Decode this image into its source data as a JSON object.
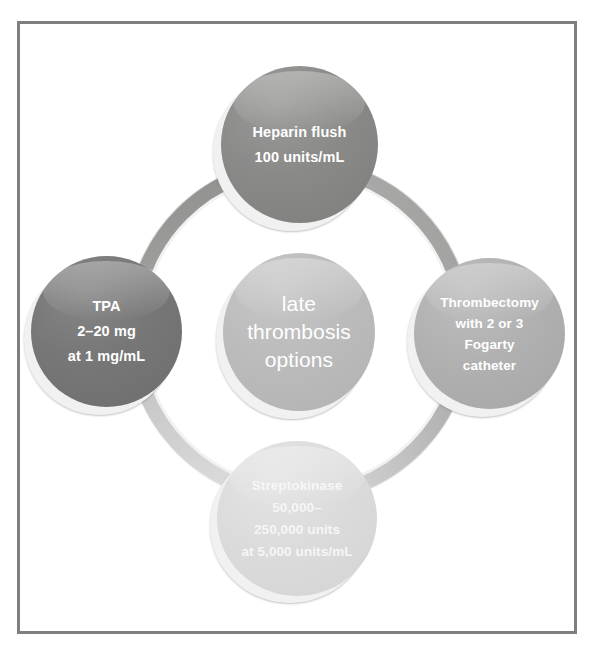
{
  "figure": {
    "title": "late thrombosis options",
    "frame_color": "#7f7f80",
    "background_color": "#ffffff",
    "ring_color": "#9b9b9b"
  },
  "center": {
    "name": "late-thrombosis-options",
    "lines": [
      "late",
      "thrombosis",
      "options"
    ],
    "color": "#bbbbbb",
    "text_color": "#ffffff"
  },
  "nodes": [
    {
      "name": "heparin-flush",
      "position": "top",
      "lines": [
        "Heparin flush",
        "100 units/mL"
      ],
      "color": "#8a8a88",
      "text_color": "#ffffff"
    },
    {
      "name": "tpa",
      "position": "left",
      "lines": [
        "TPA",
        "2–20 mg",
        "at 1 mg/mL"
      ],
      "color": "#777777",
      "text_color": "#ffffff"
    },
    {
      "name": "thrombectomy",
      "position": "right",
      "lines": [
        "Thrombectomy",
        "with 2 or 3",
        "Fogarty",
        "catheter"
      ],
      "color": "#b0b0b0",
      "text_color": "#ffffff"
    },
    {
      "name": "streptokinase",
      "position": "bottom",
      "lines": [
        "Streptokinase",
        "50,000–",
        "250,000 units",
        "at 5,000 units/mL"
      ],
      "color": "#dbdbdb",
      "text_color": "#f6f6f6"
    }
  ]
}
